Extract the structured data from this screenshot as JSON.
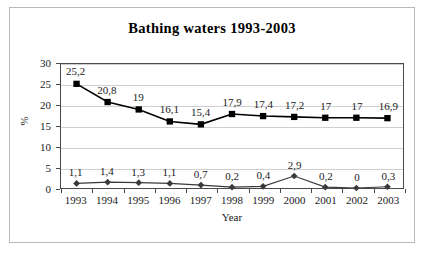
{
  "chart_data": {
    "type": "line",
    "title": "Bathing waters 1993-2003",
    "xlabel": "Year",
    "ylabel": "%",
    "ylim": [
      0,
      30
    ],
    "yticks": [
      0,
      5,
      10,
      15,
      20,
      25,
      30
    ],
    "ytick_labels": [
      "0",
      "5",
      "10",
      "15",
      "20",
      "25",
      "30"
    ],
    "grid": true,
    "legend": "none",
    "categories": [
      "1993",
      "1994",
      "1995",
      "1996",
      "1997",
      "1998",
      "1999",
      "2000",
      "2001",
      "2002",
      "2003"
    ],
    "series": [
      {
        "name": "series-1",
        "marker": "square",
        "color": "#000000",
        "values": [
          25.2,
          20.8,
          19,
          16.1,
          15.4,
          17.9,
          17.4,
          17.2,
          17,
          17,
          16.9
        ],
        "labels": [
          "25,2",
          "20,8",
          "19",
          "16,1",
          "15,4",
          "17,9",
          "17,4",
          "17,2",
          "17",
          "17",
          "16,9"
        ]
      },
      {
        "name": "series-2",
        "marker": "diamond",
        "color": "#3a3a3a",
        "values": [
          1.1,
          1.4,
          1.3,
          1.1,
          0.7,
          0.2,
          0.4,
          2.9,
          0.2,
          0,
          0.3
        ],
        "labels": [
          "1,1",
          "1,4",
          "1,3",
          "1,1",
          "0,7",
          "0,2",
          "0,4",
          "2,9",
          "0,2",
          "0",
          "0,3"
        ]
      }
    ]
  }
}
